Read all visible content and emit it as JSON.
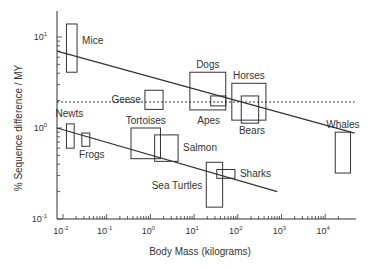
{
  "chart_data": {
    "type": "scatter",
    "title": "",
    "xlabel": "Body Mass (kilograms)",
    "ylabel": "% Sequence difference / MY",
    "xscale": "log",
    "yscale": "log",
    "xlim": [
      0.007,
      60000
    ],
    "ylim": [
      0.1,
      20
    ],
    "x_ticks": [
      {
        "base": "10",
        "exp": "-2",
        "value": 0.01
      },
      {
        "base": "10",
        "exp": "-1",
        "value": 0.1
      },
      {
        "base": "10",
        "exp": "0",
        "value": 1
      },
      {
        "base": "10",
        "exp": "1",
        "value": 10
      },
      {
        "base": "10",
        "exp": "2",
        "value": 100
      },
      {
        "base": "10",
        "exp": "3",
        "value": 1000
      },
      {
        "base": "10",
        "exp": "4",
        "value": 10000
      }
    ],
    "y_ticks": [
      {
        "base": "10",
        "exp": "1",
        "value": 10
      },
      {
        "base": "10",
        "exp": "0",
        "value": 1
      },
      {
        "base": "10",
        "exp": "-1",
        "value": 0.1
      }
    ],
    "grid": false,
    "legend": null,
    "boxes": [
      {
        "label": "Mice",
        "x_min": 0.012,
        "x_max": 0.021,
        "y_min": 4.1,
        "y_max": 13.9,
        "label_pos": "right-top"
      },
      {
        "label": "Newts",
        "x_min": 0.012,
        "x_max": 0.018,
        "y_min": 0.6,
        "y_max": 1.11,
        "label_pos": "above"
      },
      {
        "label": "Frogs",
        "x_min": 0.027,
        "x_max": 0.041,
        "y_min": 0.63,
        "y_max": 0.88,
        "label_pos": "below"
      },
      {
        "label": "Geese",
        "x_min": 0.75,
        "x_max": 1.95,
        "y_min": 1.6,
        "y_max": 2.6,
        "label_pos": "left"
      },
      {
        "label": "Tortoises",
        "x_min": 0.36,
        "x_max": 1.7,
        "y_min": 0.46,
        "y_max": 1.0,
        "label_pos": "above"
      },
      {
        "label": "Salmon",
        "x_min": 1.25,
        "x_max": 4.3,
        "y_min": 0.43,
        "y_max": 0.84,
        "label_pos": "right"
      },
      {
        "label": "Dogs",
        "x_min": 8,
        "x_max": 53,
        "y_min": 1.58,
        "y_max": 4.1,
        "label_pos": "above"
      },
      {
        "label": "Apes",
        "x_min": 24,
        "x_max": 53,
        "y_min": 1.75,
        "y_max": 2.25,
        "label_pos": "below-left"
      },
      {
        "label": "Horses",
        "x_min": 73,
        "x_max": 440,
        "y_min": 1.22,
        "y_max": 3.1,
        "label_pos": "above"
      },
      {
        "label": "Bears",
        "x_min": 120,
        "x_max": 300,
        "y_min": 1.13,
        "y_max": 2.25,
        "label_pos": "below"
      },
      {
        "label": "Sea Turtles",
        "x_min": 19,
        "x_max": 45,
        "y_min": 0.135,
        "y_max": 0.42,
        "label_pos": "left"
      },
      {
        "label": "Sharks",
        "x_min": 33,
        "x_max": 86,
        "y_min": 0.28,
        "y_max": 0.35,
        "label_pos": "right"
      },
      {
        "label": "Whales",
        "x_min": 17000,
        "x_max": 38000,
        "y_min": 0.32,
        "y_max": 0.9,
        "label_pos": "above"
      }
    ],
    "lines": [
      {
        "name": "upper-regression",
        "style": "solid",
        "x": [
          0.0073,
          47000
        ],
        "y": [
          7.0,
          0.88
        ]
      },
      {
        "name": "lower-regression",
        "style": "solid",
        "x": [
          0.0073,
          800
        ],
        "y": [
          1.0,
          0.2
        ]
      },
      {
        "name": "reference-line",
        "style": "dotted",
        "x": [
          0.0073,
          47000
        ],
        "y": [
          1.93,
          1.93
        ]
      }
    ]
  },
  "colors": {
    "stroke": "#333333",
    "text": "#333333",
    "background": "#ffffff"
  }
}
